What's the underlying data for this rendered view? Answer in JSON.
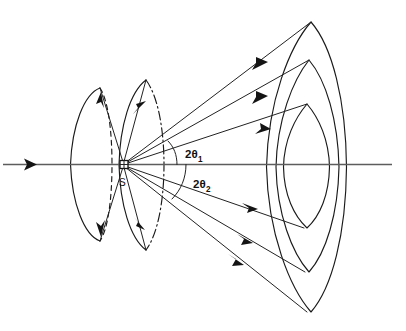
{
  "figure": {
    "kind": "diffraction-cone-diagram",
    "title": "",
    "background_color": "#ffffff",
    "ink_color": "#1a1a1a",
    "axis_color": "#5d5d5d",
    "width": 406,
    "height": 331
  },
  "labels": {
    "sample": "S",
    "angle_1_main": "2θ",
    "angle_1_sub": "1",
    "angle_2_main": "2θ",
    "angle_2_sub": "2",
    "angle_1_full": "2θ1",
    "angle_2_full": "2θ2"
  },
  "geometry": {
    "axis_y": 164.5,
    "axis_x_start": 2,
    "axis_x_end": 392,
    "sample_x": 124,
    "sample_y": 164.5,
    "sample_box_size": 8,
    "incident_arrow_tip_x": 36,
    "incident_arrow_tail_x": 3
  },
  "forward_rays": {
    "description": "Diffracted rays travelling forward-right from the sample",
    "up_count": 3,
    "down_count": 3,
    "up_endpoints": [
      {
        "x": 311,
        "y": 22
      },
      {
        "x": 309,
        "y": 60
      },
      {
        "x": 307,
        "y": 104
      }
    ],
    "down_endpoints": [
      {
        "x": 304,
        "y": 228
      },
      {
        "x": 305,
        "y": 272
      },
      {
        "x": 307,
        "y": 312
      }
    ],
    "arrow_positions_up": [
      {
        "x": 258,
        "y": 63
      },
      {
        "x": 262,
        "y": 64
      },
      {
        "x": 263,
        "y": 124
      }
    ],
    "arrow_positions_down": [
      {
        "x": 254,
        "y": 210
      },
      {
        "x": 248,
        "y": 240
      },
      {
        "x": 240,
        "y": 258
      }
    ]
  },
  "back_rays": {
    "description": "Back-diffracted rays travelling up-left and down-left from the sample",
    "count": 4
  },
  "cones": [
    {
      "name": "outer-back-cone",
      "side": "back",
      "left_arc_x": 70,
      "half_height": 76,
      "right_half_style": "dashed"
    },
    {
      "name": "inner-back-cone",
      "side": "back",
      "left_arc_x": 101,
      "half_height": 84,
      "right_half_style": "dash-dot"
    }
  ],
  "detector_ellipses": [
    {
      "name": "outer-ring",
      "cx": 305,
      "cy": 167,
      "rx": 40,
      "ry": 145
    },
    {
      "name": "middle-ring",
      "cx": 303,
      "cy": 167,
      "rx": 31,
      "ry": 107
    },
    {
      "name": "inner-ring",
      "cx": 301,
      "cy": 167,
      "rx": 24,
      "ry": 63
    }
  ]
}
